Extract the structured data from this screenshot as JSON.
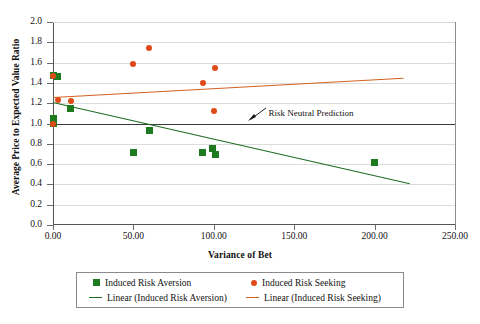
{
  "chart_data": {
    "type": "scatter",
    "title": "",
    "xlabel": "Variance of Bet",
    "ylabel": "Average Price to Expected Value Ratio",
    "xlim": [
      0,
      250
    ],
    "ylim": [
      0,
      2.0
    ],
    "xticks": [
      "0.00",
      "50.00",
      "100.00",
      "150.00",
      "200.00",
      "250.00"
    ],
    "xtick_values": [
      0,
      50,
      100,
      150,
      200,
      250
    ],
    "yticks": [
      "0.0",
      "0.2",
      "0.4",
      "0.6",
      "0.8",
      "1.0",
      "1.2",
      "1.4",
      "1.6",
      "1.8",
      "2.0"
    ],
    "ytick_values": [
      0.0,
      0.2,
      0.4,
      0.6,
      0.8,
      1.0,
      1.2,
      1.4,
      1.6,
      1.8,
      2.0
    ],
    "grid": true,
    "legend_position": "bottom",
    "series": [
      {
        "name": "Induced Risk Aversion",
        "marker": "square",
        "color": "#1e7a1e",
        "points": [
          {
            "x": 0,
            "y": 1.47
          },
          {
            "x": 3,
            "y": 1.46
          },
          {
            "x": 0,
            "y": 1.05
          },
          {
            "x": 0,
            "y": 1.0
          },
          {
            "x": 11,
            "y": 1.15
          },
          {
            "x": 50,
            "y": 0.71
          },
          {
            "x": 60,
            "y": 0.93
          },
          {
            "x": 93,
            "y": 0.71
          },
          {
            "x": 99,
            "y": 0.75
          },
          {
            "x": 101,
            "y": 0.69
          },
          {
            "x": 200,
            "y": 0.62
          }
        ]
      },
      {
        "name": "Induced Risk Seeking",
        "marker": "circle",
        "color": "#e04a18",
        "points": [
          {
            "x": 0,
            "y": 1.47
          },
          {
            "x": 0,
            "y": 1.0
          },
          {
            "x": 3,
            "y": 1.23
          },
          {
            "x": 11,
            "y": 1.22
          },
          {
            "x": 50,
            "y": 1.59
          },
          {
            "x": 60,
            "y": 1.74
          },
          {
            "x": 93,
            "y": 1.4
          },
          {
            "x": 101,
            "y": 1.55
          },
          {
            "x": 100,
            "y": 1.12
          }
        ]
      }
    ],
    "trendlines": [
      {
        "name": "Linear (Induced Risk Aversion)",
        "color": "#1e6b22",
        "x0": 0,
        "y0": 1.21,
        "x1": 222,
        "y1": 0.41
      },
      {
        "name": "Linear (Induced Risk Seeking)",
        "color": "#d2601f",
        "x0": 0,
        "y0": 1.26,
        "x1": 218,
        "y1": 1.45
      }
    ],
    "reference_lines": [
      {
        "name": "Risk Neutral Prediction",
        "color": "#3a3a3a",
        "y": 1.0,
        "x0": 0,
        "x1": 250
      }
    ],
    "annotations": [
      {
        "text": "Risk Neutral Prediction",
        "x": 134,
        "y": 1.09
      }
    ]
  },
  "legend": {
    "entries": [
      {
        "label": "Induced Risk Aversion"
      },
      {
        "label": "Induced Risk Seeking"
      },
      {
        "label": "Linear (Induced Risk Aversion)"
      },
      {
        "label": "Linear (Induced Risk Seeking)"
      }
    ]
  }
}
